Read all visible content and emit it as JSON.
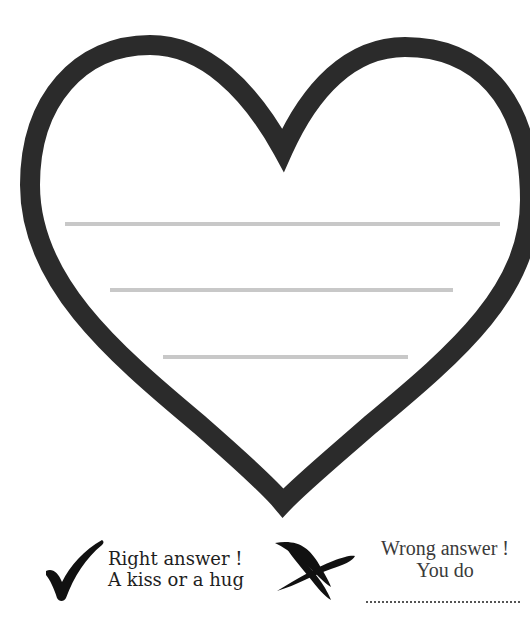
{
  "worksheet": {
    "shape": "heart",
    "outline_color": "#2b2b2b",
    "write_lines": [
      {
        "x1": 65,
        "x2": 500,
        "y": 224
      },
      {
        "x1": 110,
        "x2": 453,
        "y": 290
      },
      {
        "x1": 163,
        "x2": 408,
        "y": 357
      }
    ],
    "line_color": "#c8c8c8"
  },
  "legend": {
    "right": {
      "icon": "checkmark-icon",
      "line1": "Right answer !",
      "line2": "A kiss or a hug"
    },
    "wrong": {
      "icon": "cross-icon",
      "line1": "Wrong answer !",
      "line2": "You do",
      "blank": "...................................."
    }
  }
}
